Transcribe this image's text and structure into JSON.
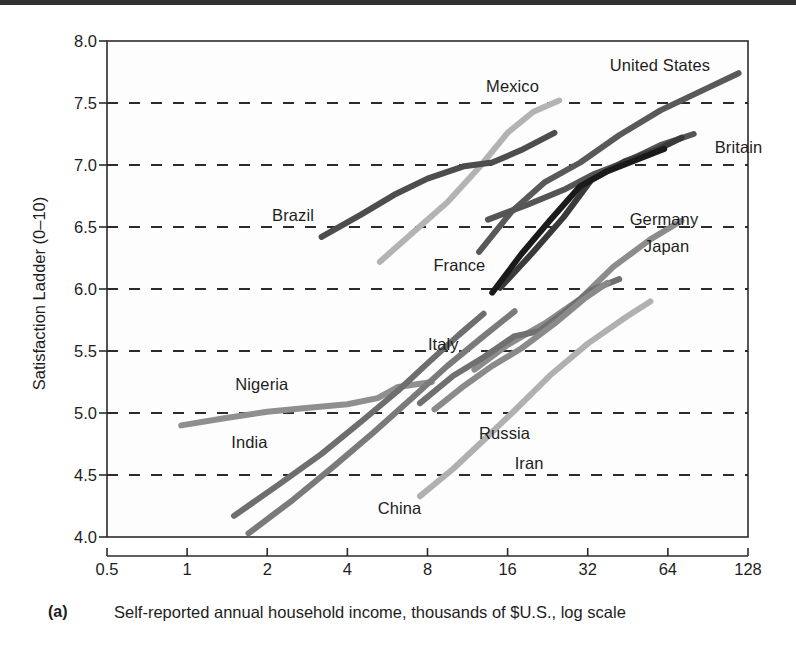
{
  "figure": {
    "panel_label": "(a)",
    "xlabel": "Self-reported annual household income, thousands of $U.S., log scale",
    "ylabel": "Satisfaction Ladder (0–10)"
  },
  "chart_data": {
    "type": "line",
    "title": "",
    "xlabel": "Self-reported annual household income, thousands of $U.S., log scale",
    "ylabel": "Satisfaction Ladder (0–10)",
    "xscale": "log2",
    "xlim": [
      0.5,
      128
    ],
    "ylim": [
      4.0,
      8.0
    ],
    "xticks": [
      0.5,
      1,
      2,
      4,
      8,
      16,
      32,
      64,
      128
    ],
    "xticklabels": [
      "0.5",
      "1",
      "2",
      "4",
      "8",
      "16",
      "32",
      "64",
      "128"
    ],
    "yticks": [
      4.0,
      4.5,
      5.0,
      5.5,
      6.0,
      6.5,
      7.0,
      7.5,
      8.0
    ],
    "yticklabels": [
      "4.0",
      "4.5",
      "5.0",
      "5.5",
      "6.0",
      "6.5",
      "7.0",
      "7.5",
      "8.0"
    ],
    "grid": "horizontal-dashed",
    "legend": "inline-labels",
    "series": [
      {
        "name": "United States",
        "color": "#595959",
        "width": 6,
        "label_x": 92,
        "label_y": 7.79,
        "label_anchor": "end",
        "points": [
          [
            12.5,
            6.3
          ],
          [
            16.5,
            6.62
          ],
          [
            22,
            6.86
          ],
          [
            30,
            7.02
          ],
          [
            42,
            7.24
          ],
          [
            60,
            7.44
          ],
          [
            90,
            7.62
          ],
          [
            118,
            7.74
          ]
        ]
      },
      {
        "name": "Britain",
        "color": "#555555",
        "width": 6,
        "label_x": 96,
        "label_y": 7.13,
        "label_anchor": "start",
        "points": [
          [
            13.5,
            6.56
          ],
          [
            19,
            6.68
          ],
          [
            26,
            6.8
          ],
          [
            34,
            6.93
          ],
          [
            45,
            7.03
          ],
          [
            60,
            7.16
          ],
          [
            80,
            7.25
          ]
        ]
      },
      {
        "name": "Germany",
        "color": "#3a3a3a",
        "width": 6,
        "label_x": 46,
        "label_y": 6.55,
        "label_anchor": "start",
        "points": [
          [
            15,
            6.01
          ],
          [
            20,
            6.3
          ],
          [
            26,
            6.58
          ],
          [
            33,
            6.88
          ],
          [
            44,
            7.03
          ],
          [
            58,
            7.12
          ],
          [
            72,
            7.22
          ]
        ]
      },
      {
        "name": "France",
        "color": "#1a1a1a",
        "width": 6,
        "label_x": 13.2,
        "label_y": 6.18,
        "label_anchor": "end",
        "points": [
          [
            14,
            5.97
          ],
          [
            18,
            6.28
          ],
          [
            23,
            6.55
          ],
          [
            30,
            6.83
          ],
          [
            38,
            6.95
          ],
          [
            50,
            7.05
          ],
          [
            62,
            7.13
          ]
        ]
      },
      {
        "name": "Mexico",
        "color": "#b3b3b3",
        "width": 6,
        "label_x": 21,
        "label_y": 7.62,
        "label_anchor": "end",
        "points": [
          [
            5.3,
            6.22
          ],
          [
            7,
            6.45
          ],
          [
            9.5,
            6.7
          ],
          [
            12.5,
            6.98
          ],
          [
            16,
            7.26
          ],
          [
            20,
            7.43
          ],
          [
            25,
            7.52
          ]
        ]
      },
      {
        "name": "Brazil",
        "color": "#4d4d4d",
        "width": 6,
        "label_x": 3.0,
        "label_y": 6.58,
        "label_anchor": "end",
        "points": [
          [
            3.2,
            6.42
          ],
          [
            4.5,
            6.6
          ],
          [
            6,
            6.76
          ],
          [
            8,
            6.89
          ],
          [
            11,
            6.99
          ],
          [
            14,
            7.02
          ],
          [
            18,
            7.12
          ],
          [
            24,
            7.26
          ]
        ]
      },
      {
        "name": "Japan",
        "color": "#8c8c8c",
        "width": 6,
        "label_x": 52,
        "label_y": 6.33,
        "label_anchor": "start",
        "points": [
          [
            12,
            5.35
          ],
          [
            16,
            5.55
          ],
          [
            22,
            5.72
          ],
          [
            30,
            5.92
          ],
          [
            40,
            6.18
          ],
          [
            55,
            6.4
          ],
          [
            72,
            6.55
          ]
        ]
      },
      {
        "name": "Italy",
        "color": "#707070",
        "width": 6,
        "label_x": 10.5,
        "label_y": 5.54,
        "label_anchor": "end",
        "points": [
          [
            7.5,
            5.08
          ],
          [
            10,
            5.3
          ],
          [
            13,
            5.45
          ],
          [
            17,
            5.62
          ],
          [
            21,
            5.66
          ],
          [
            26,
            5.81
          ],
          [
            33,
            5.99
          ],
          [
            42,
            6.08
          ]
        ]
      },
      {
        "name": "Russia",
        "color": "#8a8a8a",
        "width": 6,
        "label_x": 12.5,
        "label_y": 4.82,
        "label_anchor": "start",
        "points": [
          [
            8.5,
            5.03
          ],
          [
            11,
            5.22
          ],
          [
            14,
            5.38
          ],
          [
            18,
            5.52
          ],
          [
            24,
            5.72
          ],
          [
            31,
            5.92
          ],
          [
            38,
            6.05
          ]
        ]
      },
      {
        "name": "Iran",
        "color": "#b0b0b0",
        "width": 6,
        "label_x": 17,
        "label_y": 4.58,
        "label_anchor": "start",
        "points": [
          [
            7.5,
            4.33
          ],
          [
            10,
            4.55
          ],
          [
            13,
            4.78
          ],
          [
            17,
            5.02
          ],
          [
            23,
            5.3
          ],
          [
            32,
            5.56
          ],
          [
            45,
            5.78
          ],
          [
            55,
            5.9
          ]
        ]
      },
      {
        "name": "Nigeria",
        "color": "#8f8f8f",
        "width": 6,
        "label_x": 2.4,
        "label_y": 5.22,
        "label_anchor": "end",
        "points": [
          [
            0.95,
            4.9
          ],
          [
            1.4,
            4.96
          ],
          [
            2,
            5.01
          ],
          [
            2.8,
            5.04
          ],
          [
            4,
            5.07
          ],
          [
            5.2,
            5.12
          ],
          [
            6.2,
            5.21
          ],
          [
            8.3,
            5.25
          ]
        ]
      },
      {
        "name": "India",
        "color": "#6e6e6e",
        "width": 6,
        "label_x": 2.0,
        "label_y": 4.75,
        "label_anchor": "end",
        "points": [
          [
            1.5,
            4.17
          ],
          [
            2.2,
            4.42
          ],
          [
            3.2,
            4.67
          ],
          [
            4.5,
            4.93
          ],
          [
            6.2,
            5.18
          ],
          [
            8,
            5.4
          ],
          [
            10.5,
            5.63
          ],
          [
            13,
            5.8
          ]
        ]
      },
      {
        "name": "China",
        "color": "#7a7a7a",
        "width": 6,
        "label_x": 5.2,
        "label_y": 4.22,
        "label_anchor": "start",
        "points": [
          [
            1.7,
            4.03
          ],
          [
            2.5,
            4.3
          ],
          [
            3.6,
            4.58
          ],
          [
            5,
            4.84
          ],
          [
            7,
            5.12
          ],
          [
            9.5,
            5.38
          ],
          [
            13,
            5.62
          ],
          [
            17,
            5.82
          ]
        ]
      }
    ]
  }
}
